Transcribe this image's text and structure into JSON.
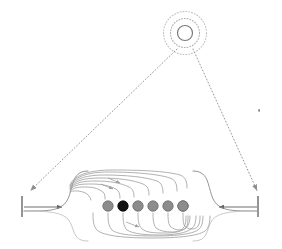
{
  "figure": {
    "background_color": "#ffffff",
    "width": 282,
    "height": 249
  },
  "target": {
    "name": "concentric-target",
    "center_x": 185,
    "center_y": 33,
    "inner_circle": {
      "radius": 7.5,
      "stroke_color": "#7a7a7a",
      "style": "solid"
    },
    "middle_circle": {
      "radius": 14.5,
      "stroke_color": "#b0b0b0",
      "style": "dotted"
    },
    "outer_circle": {
      "radius": 21.5,
      "stroke_color": "#c2c2c2",
      "style": "dotted"
    }
  },
  "sight_lines": {
    "color": "#9a9a9a",
    "style": "dotted",
    "left": {
      "x1": 176,
      "y1": 50,
      "x2": 29,
      "y2": 192,
      "arrow_at": "end"
    },
    "right": {
      "x1": 194,
      "y1": 50,
      "x2": 258,
      "y2": 192,
      "arrow_at": "end"
    }
  },
  "boundaries": {
    "color": "#5c5c5c",
    "left_bar": {
      "x": 22,
      "y_top": 196,
      "y_bottom": 217
    },
    "right_bar": {
      "x": 258,
      "y_top": 196,
      "y_bottom": 217
    },
    "left_inflow": {
      "x1": 24,
      "y1": 207,
      "x2": 68,
      "y2": 207,
      "direction": "right"
    },
    "right_inflow": {
      "x1": 256,
      "y1": 207,
      "x2": 212,
      "y2": 207,
      "direction": "left"
    }
  },
  "nodes": {
    "name": "field-node-row",
    "count": 7,
    "radius": 5.2,
    "y": 206,
    "default_fill": "#8c8c8c",
    "default_stroke": "#6b6b6b",
    "highlight_fill": "#111111",
    "highlight_stroke": "#000000",
    "highlight_index": 2,
    "items": [
      {
        "index": 0,
        "x": 93,
        "highlighted": false
      },
      {
        "index": 1,
        "x": 108,
        "highlighted": false
      },
      {
        "index": 2,
        "x": 123,
        "highlighted": true
      },
      {
        "index": 3,
        "x": 138,
        "highlighted": false
      },
      {
        "index": 4,
        "x": 153,
        "highlighted": false
      },
      {
        "index": 5,
        "x": 168,
        "highlighted": false
      },
      {
        "index": 6,
        "x": 183,
        "highlighted": false
      }
    ]
  },
  "flux_curves": {
    "color": "#9e9e9e",
    "upper_count": 7,
    "lower_count": 7,
    "upper_origin_x": 70,
    "upper_apex_y": 172,
    "lower_terminus_x": 212,
    "lower_trough_y": 238
  },
  "stray_mark": {
    "name": "stray-dot",
    "x": 259,
    "y": 110,
    "color": "#8a8a8a",
    "size": 1.6
  }
}
